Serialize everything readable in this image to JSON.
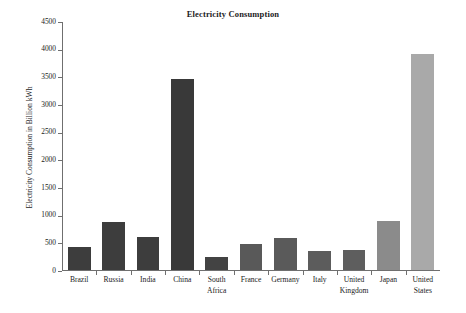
{
  "chart_data": {
    "type": "bar",
    "title": "Electricity Consumption",
    "xlabel": "",
    "ylabel": "Electricity Consumption in Billion kWh",
    "categories": [
      "Brazil",
      "Russia",
      "India",
      "China",
      "South Africa",
      "France",
      "Germany",
      "Italy",
      "United Kingdom",
      "Japan",
      "United States"
    ],
    "values": [
      415,
      870,
      590,
      3450,
      235,
      470,
      575,
      345,
      370,
      880,
      3900
    ],
    "ylim": [
      0,
      4500
    ],
    "ytick_labels": [
      "0",
      "500",
      "1000",
      "1500",
      "2000",
      "2500",
      "3000",
      "3500",
      "4000",
      "4500"
    ],
    "ytick_values": [
      0,
      500,
      1000,
      1500,
      2000,
      2500,
      3000,
      3500,
      4000,
      4500
    ],
    "grid": false,
    "legend": "none",
    "bar_colors": [
      "#3d3d3d",
      "#3d3d3d",
      "#3d3d3d",
      "#393939",
      "#434343",
      "#595959",
      "#5a5a5a",
      "#5c5c5c",
      "#5e5e5e",
      "#8b8b8b",
      "#a9a9a9"
    ],
    "axis_color": "#6f6f6f",
    "background_color": "#ffffff",
    "text_color": "#1b1b1b"
  }
}
